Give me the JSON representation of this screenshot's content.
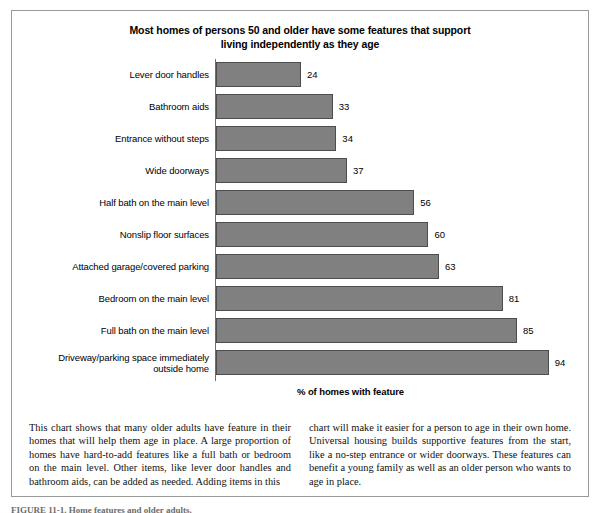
{
  "figure": {
    "title_line1": "Most homes of persons 50 and older have some features that support",
    "title_line2": "living independently as they age",
    "x_axis_title": "% of homes with feature",
    "bottom_caption": "FIGURE 11-1. Home features and older adults."
  },
  "caption": {
    "left": "This chart shows that many older adults have feature in their homes that will help them age in place. A large proportion of homes have hard-to-add features like a full bath or bedroom on the main level. Other items, like lever door handles and bathroom aids, can be added as needed. Adding items in this",
    "right": "chart will make it easier for a person to age in their own home. Universal housing builds supportive features from the start, like a no-step entrance or wider doorways. These features can benefit a young family as well as an older person who wants to age in place."
  },
  "chart_data": {
    "type": "bar",
    "orientation": "horizontal",
    "title": "Most homes of persons 50 and older have some features that support living independently as they age",
    "xlabel": "% of homes with feature",
    "ylabel": "",
    "xlim": [
      0,
      100
    ],
    "grid": false,
    "legend": false,
    "bar_color": "#808080",
    "bar_edge_color": "#4d4d4d",
    "categories": [
      "Lever door handles",
      "Bathroom aids",
      "Entrance without steps",
      "Wide doorways",
      "Half bath on the main level",
      "Nonslip floor surfaces",
      "Attached garage/covered parking",
      "Bedroom on the main level",
      "Full bath on the main level",
      "Driveway/parking space immediately outside home"
    ],
    "values": [
      24,
      33,
      34,
      37,
      56,
      60,
      63,
      81,
      85,
      94
    ]
  }
}
